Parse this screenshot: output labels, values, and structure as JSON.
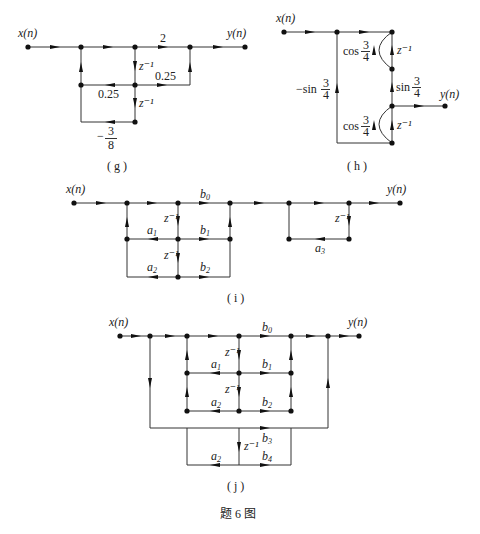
{
  "figure": {
    "caption": "题 6 图",
    "panels": {
      "g": {
        "caption": "( g )",
        "input": "x(n)",
        "output": "y(n)",
        "gains": {
          "top": "2",
          "right_branch": "0.25",
          "left_feedback": "0.25",
          "bottom_feedback_num": "3",
          "bottom_feedback_den": "8",
          "bottom_feedback_sign": "−"
        },
        "delays": [
          "z⁻¹",
          "z⁻¹"
        ]
      },
      "h": {
        "caption": "( h )",
        "input": "x(n)",
        "output": "y(n)",
        "gains": {
          "upper_cos": "cos",
          "lower_cos": "cos",
          "middle_sin": "sin",
          "left_sin": "−sin",
          "frac_num": "3",
          "frac_den": "4"
        },
        "delays": [
          "z⁻¹",
          "z⁻¹"
        ]
      },
      "i": {
        "caption": "( i )",
        "input": "x(n)",
        "output": "y(n)",
        "gains": {
          "b0": "b",
          "b0_sub": "0",
          "a1": "a",
          "a1_sub": "1",
          "b1": "b",
          "b1_sub": "1",
          "a2": "a",
          "a2_sub": "2",
          "b2": "b",
          "b2_sub": "2",
          "a3": "a",
          "a3_sub": "3"
        },
        "delays": [
          "z⁻¹",
          "z⁻¹",
          "z⁻¹"
        ]
      },
      "j": {
        "caption": "( j )",
        "input": "x(n)",
        "output": "y(n)",
        "gains": {
          "b0": "b",
          "b0_sub": "0",
          "a1": "a",
          "a1_sub": "1",
          "b1": "b",
          "b1_sub": "1",
          "a2": "a",
          "a2_sub": "2",
          "b2": "b",
          "b2_sub": "2",
          "b3": "b",
          "b3_sub": "3",
          "a2b": "a",
          "a2b_sub": "2",
          "b4": "b",
          "b4_sub": "4"
        },
        "delays": [
          "z⁻¹",
          "z⁻¹",
          "z⁻¹"
        ]
      }
    }
  }
}
